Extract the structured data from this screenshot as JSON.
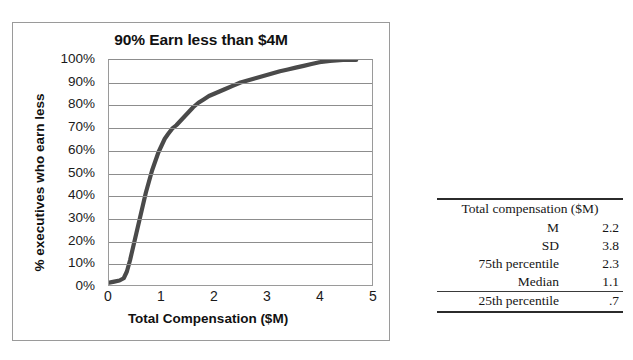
{
  "chart_data": {
    "type": "line",
    "title": "90% Earn less than $4M",
    "xlabel": "Total Compensation ($M)",
    "ylabel": "% executives who earn less",
    "xlim": [
      0,
      5
    ],
    "ylim": [
      0,
      100
    ],
    "grid": true,
    "legend_position": "none",
    "xticks": [
      "0",
      "1",
      "2",
      "3",
      "4",
      "5"
    ],
    "yticks": [
      "100%",
      "90%",
      "80%",
      "70%",
      "60%",
      "50%",
      "40%",
      "30%",
      "20%",
      "10%",
      "0%"
    ],
    "series": [
      {
        "name": "Cumulative % of executives earning less",
        "color": "#4a4a4a",
        "x": [
          0.0,
          0.1,
          0.2,
          0.28,
          0.34,
          0.4,
          0.46,
          0.52,
          0.58,
          0.64,
          0.7,
          0.76,
          0.82,
          0.88,
          0.94,
          1.0,
          1.06,
          1.12,
          1.2,
          1.28,
          1.36,
          1.44,
          1.52,
          1.6,
          1.7,
          1.8,
          1.9,
          2.0,
          2.1,
          2.2,
          2.35,
          2.5,
          2.65,
          2.8,
          2.95,
          3.1,
          3.25,
          3.4,
          3.55,
          3.7,
          3.85,
          4.0,
          4.2,
          4.45,
          4.7
        ],
        "y": [
          1,
          1.5,
          2,
          3,
          6,
          11,
          17,
          23,
          29,
          35,
          41,
          46,
          51,
          55,
          59,
          62,
          65,
          67,
          69.5,
          71,
          73,
          75,
          77,
          79,
          81,
          82.5,
          84,
          85,
          86,
          87,
          88.5,
          90,
          91,
          92,
          93,
          94,
          95,
          95.8,
          96.6,
          97.4,
          98.2,
          99,
          99.6,
          100,
          100
        ]
      }
    ],
    "annotations": []
  },
  "stats_table": {
    "header": "Total compensation ($M)",
    "rows": [
      {
        "label": "M",
        "value": "2.2"
      },
      {
        "label": "SD",
        "value": "3.8"
      },
      {
        "label": "75th percentile",
        "value": "2.3"
      },
      {
        "label": "Median",
        "value": "1.1"
      },
      {
        "label": "25th percentile",
        "value": ".7"
      }
    ]
  },
  "style": {
    "curve_color": "#4a4a4a",
    "gridline_color": "#8d8d8d",
    "frame_color": "#9a9a9a",
    "text_color": "#111111",
    "table_rule_color": "#2b2b2b"
  }
}
